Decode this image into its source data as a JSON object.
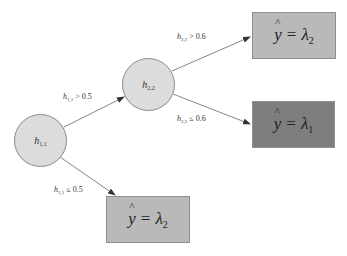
{
  "diagram": {
    "type": "decision-tree",
    "colors": {
      "node_fill": "#dcdcdc",
      "node_stroke": "#8a8a8a",
      "leaf_light_fill": "#b9b9b9",
      "leaf_dark_fill": "#7e7e7e",
      "edge_color": "#555555"
    },
    "nodes": [
      {
        "id": "h11",
        "var": "h",
        "sub": "1,1"
      },
      {
        "id": "h22",
        "var": "h",
        "sub": "2,2"
      }
    ],
    "leaves": [
      {
        "id": "leaf-top",
        "hat": "^",
        "y": "y",
        "eq": "=",
        "lambda": "λ",
        "sub": "2"
      },
      {
        "id": "leaf-middle",
        "hat": "^",
        "y": "y",
        "eq": "=",
        "lambda": "λ",
        "sub": "1"
      },
      {
        "id": "leaf-bottom",
        "hat": "^",
        "y": "y",
        "eq": "=",
        "lambda": "λ",
        "sub": "2"
      }
    ],
    "edges": [
      {
        "from": "h11",
        "to": "h22",
        "var": "h",
        "sub": "1,1",
        "op": "> 0.5"
      },
      {
        "from": "h11",
        "to": "leaf-bottom",
        "var": "h",
        "sub": "1,1",
        "op": "≤ 0.5"
      },
      {
        "from": "h22",
        "to": "leaf-top",
        "var": "h",
        "sub": "2,2",
        "op": "> 0.6"
      },
      {
        "from": "h22",
        "to": "leaf-middle",
        "var": "h",
        "sub": "2,2",
        "op": "≤ 0.6"
      }
    ]
  }
}
